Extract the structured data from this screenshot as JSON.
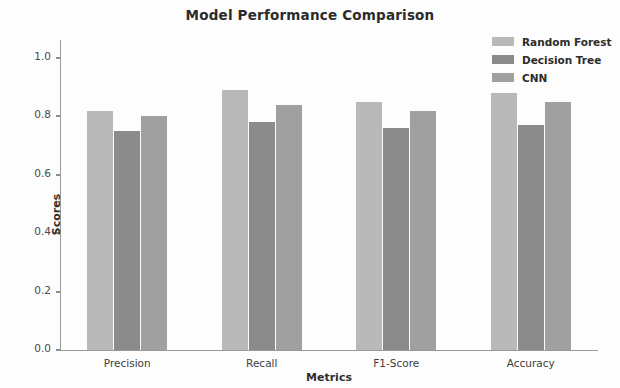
{
  "chart_data": {
    "type": "bar",
    "title": "Model Performance Comparison",
    "xlabel": "Metrics",
    "ylabel": "Scores",
    "categories": [
      "Precision",
      "Recall",
      "F1-Score",
      "Accuracy"
    ],
    "series": [
      {
        "name": "Random Forest",
        "values": [
          0.82,
          0.89,
          0.85,
          0.88
        ],
        "color": "#b9b9b9"
      },
      {
        "name": "Decision Tree",
        "values": [
          0.75,
          0.78,
          0.76,
          0.77
        ],
        "color": "#8b8b8b"
      },
      {
        "name": "CNN",
        "values": [
          0.8,
          0.84,
          0.82,
          0.85
        ],
        "color": "#a0a0a0"
      }
    ],
    "ylim": [
      0.0,
      1.05
    ],
    "yticks": [
      0.0,
      0.2,
      0.4,
      0.6,
      0.8,
      1.0
    ],
    "ytick_labels": [
      "0.0",
      "0.2",
      "0.4",
      "0.6",
      "0.8",
      "1.0"
    ],
    "grid": false,
    "legend_position": "top-right",
    "background_color": "#fdfdfd",
    "axis_color": "#9a9a9a"
  }
}
